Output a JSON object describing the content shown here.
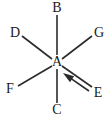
{
  "diagram": {
    "type": "chemical-structure-bond-diagram",
    "background_color": "#ffffff",
    "bond_color": "#2b2b2b",
    "label_color": "#1a1a1a",
    "center_atom": {
      "label": "A",
      "x": 57,
      "y": 62
    },
    "atoms": [
      {
        "id": "B",
        "label": "B",
        "x": 57,
        "y": 8,
        "position": "top"
      },
      {
        "id": "D",
        "label": "D",
        "x": 15,
        "y": 33,
        "position": "upper-left"
      },
      {
        "id": "G",
        "label": "G",
        "x": 99,
        "y": 33,
        "position": "upper-right"
      },
      {
        "id": "F",
        "label": "F",
        "x": 10,
        "y": 89,
        "position": "lower-left"
      },
      {
        "id": "E",
        "label": "E",
        "x": 98,
        "y": 93,
        "position": "lower-right"
      },
      {
        "id": "C",
        "label": "C",
        "x": 57,
        "y": 110,
        "position": "bottom"
      }
    ],
    "bonds": [
      {
        "from": "A",
        "to": "B",
        "x1": 57,
        "y1": 55,
        "x2": 57,
        "y2": 15
      },
      {
        "from": "A",
        "to": "C",
        "x1": 57,
        "y1": 69,
        "x2": 57,
        "y2": 103
      },
      {
        "from": "A",
        "to": "D",
        "x1": 52,
        "y1": 59,
        "x2": 22,
        "y2": 36
      },
      {
        "from": "A",
        "to": "G",
        "x1": 62,
        "y1": 59,
        "x2": 92,
        "y2": 36
      },
      {
        "from": "A",
        "to": "F",
        "x1": 52,
        "y1": 66,
        "x2": 18,
        "y2": 86
      },
      {
        "from": "A",
        "to": "E",
        "x1": 62,
        "y1": 66,
        "x2": 92,
        "y2": 87
      }
    ],
    "arrow": {
      "name": "attack-arrow",
      "direction": "toward-center-atom",
      "tail_x": 89,
      "tail_y": 91,
      "tip_x": 63,
      "tip_y": 73
    }
  }
}
